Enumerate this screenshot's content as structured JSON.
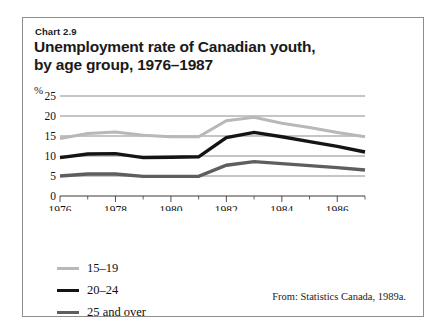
{
  "figure": {
    "chart_label": "Chart 2.9",
    "title_line1": "Unemployment rate of Canadian youth,",
    "title_line2": "by age group, 1976–1987",
    "source": "From: Statistics Canada, 1989a."
  },
  "legend": {
    "position": "bottom-left",
    "items": [
      {
        "label": "15–19",
        "color": "#b8b8b8",
        "width": 3
      },
      {
        "label": "20–24",
        "color": "#141414",
        "width": 3.4
      },
      {
        "label": "25 and over",
        "color": "#5e5e5e",
        "width": 3.4
      }
    ]
  },
  "axes": {
    "y_unit": "%",
    "y_ticks": [
      25,
      20,
      15,
      10,
      5,
      0
    ],
    "x_ticks_major": [
      1976,
      1978,
      1980,
      1982,
      1984,
      1986
    ],
    "x_ticks_minor": [
      1977,
      1979,
      1981,
      1983,
      1985,
      1987
    ]
  },
  "chart_data": {
    "type": "line",
    "title": "Unemployment rate of Canadian youth, by age group, 1976–1987",
    "xlabel": "",
    "ylabel": "%",
    "xlim": [
      1976,
      1987
    ],
    "ylim": [
      0,
      25
    ],
    "grid": true,
    "legend_position": "bottom-left",
    "x": [
      1976,
      1977,
      1978,
      1979,
      1980,
      1981,
      1982,
      1983,
      1984,
      1985,
      1986,
      1987
    ],
    "series": [
      {
        "name": "15–19",
        "color": "#b8b8b8",
        "values": [
          14.4,
          15.6,
          16.0,
          15.2,
          14.8,
          14.8,
          18.8,
          19.7,
          18.2,
          17.1,
          15.9,
          14.8
        ]
      },
      {
        "name": "20–24",
        "color": "#141414",
        "values": [
          9.6,
          10.5,
          10.6,
          9.6,
          9.7,
          9.8,
          14.6,
          15.9,
          14.8,
          13.6,
          12.4,
          11.0
        ]
      },
      {
        "name": "25 and over",
        "color": "#5e5e5e",
        "values": [
          5.0,
          5.5,
          5.5,
          4.9,
          4.9,
          4.9,
          7.7,
          8.6,
          8.1,
          7.6,
          7.1,
          6.5
        ]
      }
    ]
  }
}
